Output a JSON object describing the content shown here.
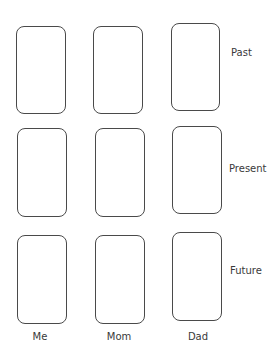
{
  "rows": [
    {
      "label": "Past"
    },
    {
      "label": "Present"
    },
    {
      "label": "Future"
    }
  ],
  "columns": [
    {
      "label": "Me"
    },
    {
      "label": "Mom"
    },
    {
      "label": "Dad"
    }
  ],
  "card_border_color": "#4a4a4a",
  "text_color": "#3a3a3a"
}
